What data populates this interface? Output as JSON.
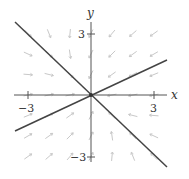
{
  "figure": {
    "type": "phase-portrait",
    "axes": {
      "x_label": "x",
      "y_label": "y",
      "x_ticks": [
        {
          "value": -3,
          "label": "−3"
        },
        {
          "value": 3,
          "label": "3"
        }
      ],
      "y_ticks": [
        {
          "value": 3,
          "label": "3"
        },
        {
          "value": -3,
          "label": "−3"
        }
      ],
      "range": [
        -3.6,
        3.6
      ]
    },
    "straight_line_solutions": [
      {
        "name": "line-y-eq-neg-x",
        "equation": "y = -x"
      },
      {
        "name": "line-y-eq-half-x",
        "equation": "y = x/2"
      }
    ],
    "colors": {
      "axis": "#555555",
      "line": "#444444",
      "field": "#c8c8c8",
      "text": "#333333"
    }
  }
}
